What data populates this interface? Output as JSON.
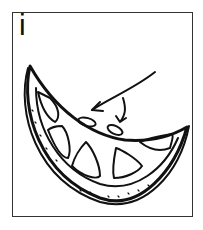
{
  "card": {
    "letter": "i",
    "illustration": "orange-slice-icon",
    "annotation": "arrow pointing to seeds"
  },
  "colors": {
    "ink": "#111111",
    "paper": "#ffffff",
    "frame": "#333333"
  }
}
